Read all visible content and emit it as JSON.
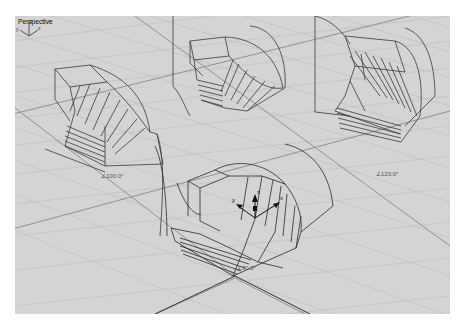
{
  "viewport": {
    "title": "Perspective",
    "background": "#d4d4d4",
    "grid_minor_color": "#bdbdbd",
    "grid_major_color": "#8a8a8a",
    "wire_color": "#3a3a3a"
  },
  "objects": [
    {
      "name": "left-bend",
      "angle_label": "∠100.0°"
    },
    {
      "name": "right-bend",
      "angle_label": "∠120.0°"
    },
    {
      "name": "center-bend",
      "angle_label": "∠90.0°"
    },
    {
      "name": "back-bend",
      "angle_label": ""
    }
  ],
  "gumball": {
    "axes": [
      "x",
      "y",
      "z"
    ]
  },
  "axis_icon": {
    "x": "x",
    "y": "y",
    "z": "z"
  }
}
